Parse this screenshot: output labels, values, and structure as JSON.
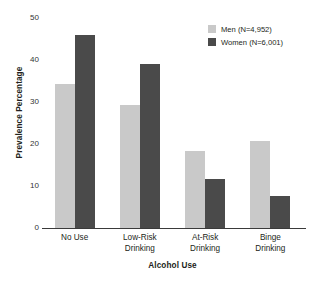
{
  "chart_data": {
    "type": "bar",
    "title": "",
    "xlabel": "Alcohol Use",
    "ylabel": "Prevalence Percentage",
    "categories": [
      "No Use",
      "Low-Risk Drinking",
      "At-Risk Drinking",
      "Binge Drinking"
    ],
    "category_lines": [
      [
        "No Use"
      ],
      [
        "Low-Risk",
        "Drinking"
      ],
      [
        "At-Risk",
        "Drinking"
      ],
      [
        "Binge",
        "Drinking"
      ]
    ],
    "series": [
      {
        "name": "Men (N=4,952)",
        "short_name": "Men",
        "color": "#c9c9c9",
        "values": [
          34.3,
          29.4,
          18.3,
          20.7
        ]
      },
      {
        "name": "Women (N=6,001)",
        "short_name": "Women",
        "color": "#4a4a4a",
        "values": [
          46.0,
          39.0,
          11.6,
          7.7
        ]
      }
    ],
    "ylim": [
      0,
      50
    ],
    "yticks": [
      0,
      10,
      20,
      30,
      40,
      50
    ],
    "ytick_labels": [
      "0",
      "10",
      "20",
      "30",
      "40",
      "50"
    ],
    "grid": false,
    "legend_position": "top-right"
  },
  "legend": {
    "items": [
      {
        "label": "Men (N=4,952)",
        "color": "#c9c9c9"
      },
      {
        "label": "Women (N=6,001)",
        "color": "#4a4a4a"
      }
    ]
  },
  "axes": {
    "y_title": "Prevalence Percentage",
    "x_title": "Alcohol Use"
  }
}
